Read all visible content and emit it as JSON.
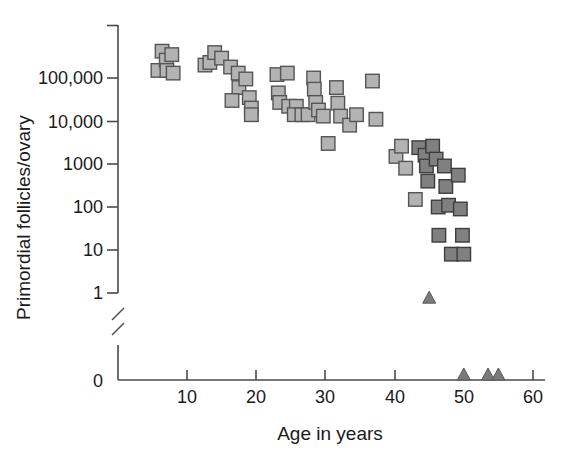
{
  "chart_data": {
    "type": "scatter",
    "title": "",
    "xlabel": "Age in years",
    "ylabel": "Primordial follicles/ovary",
    "xlim": [
      0,
      60
    ],
    "ylim_log": [
      1,
      1000000
    ],
    "yscale": "log",
    "grid": false,
    "axis_break": true,
    "axis_break_note": "Break between 1 and 0 on the y-axis",
    "xticks": [
      10,
      20,
      30,
      40,
      50,
      60
    ],
    "xtick_labels": [
      "10",
      "20",
      "30",
      "40",
      "50",
      "60"
    ],
    "yticks": [
      0,
      1,
      10,
      100,
      1000,
      10000,
      100000
    ],
    "ytick_labels": [
      "0",
      "1",
      "10",
      "100",
      "1000",
      "10,000",
      "100,000"
    ],
    "legend": [],
    "series": [
      {
        "name": "light-squares",
        "marker": "square",
        "color": "#b3b3b3",
        "points": [
          {
            "age": 5.8,
            "follicles": 150000
          },
          {
            "age": 6.4,
            "follicles": 420000
          },
          {
            "age": 7.0,
            "follicles": 260000
          },
          {
            "age": 7.1,
            "follicles": 150000
          },
          {
            "age": 7.8,
            "follicles": 350000
          },
          {
            "age": 8.0,
            "follicles": 130000
          },
          {
            "age": 12.6,
            "follicles": 200000
          },
          {
            "age": 13.3,
            "follicles": 230000
          },
          {
            "age": 14.0,
            "follicles": 390000
          },
          {
            "age": 15.0,
            "follicles": 290000
          },
          {
            "age": 16.3,
            "follicles": 180000
          },
          {
            "age": 17.4,
            "follicles": 130000
          },
          {
            "age": 17.5,
            "follicles": 60000
          },
          {
            "age": 18.5,
            "follicles": 95000
          },
          {
            "age": 19.0,
            "follicles": 35000
          },
          {
            "age": 19.3,
            "follicles": 20000
          },
          {
            "age": 19.3,
            "follicles": 14000
          },
          {
            "age": 16.5,
            "follicles": 30000
          },
          {
            "age": 23.0,
            "follicles": 120000
          },
          {
            "age": 23.2,
            "follicles": 45000
          },
          {
            "age": 23.4,
            "follicles": 27000
          },
          {
            "age": 24.5,
            "follicles": 130000
          },
          {
            "age": 24.7,
            "follicles": 22000
          },
          {
            "age": 25.8,
            "follicles": 22000
          },
          {
            "age": 25.5,
            "follicles": 14000
          },
          {
            "age": 26.6,
            "follicles": 14000
          },
          {
            "age": 27.5,
            "follicles": 14000
          },
          {
            "age": 28.3,
            "follicles": 100000
          },
          {
            "age": 28.4,
            "follicles": 55000
          },
          {
            "age": 28.6,
            "follicles": 27000
          },
          {
            "age": 29.0,
            "follicles": 18000
          },
          {
            "age": 29.7,
            "follicles": 13000
          },
          {
            "age": 30.4,
            "follicles": 3000
          },
          {
            "age": 31.6,
            "follicles": 60000
          },
          {
            "age": 31.8,
            "follicles": 26000
          },
          {
            "age": 32.2,
            "follicles": 13000
          },
          {
            "age": 33.5,
            "follicles": 8000
          },
          {
            "age": 34.5,
            "follicles": 14000
          },
          {
            "age": 36.8,
            "follicles": 85000
          },
          {
            "age": 37.3,
            "follicles": 11000
          },
          {
            "age": 40.2,
            "follicles": 1500
          },
          {
            "age": 41.0,
            "follicles": 2600
          },
          {
            "age": 41.6,
            "follicles": 800
          },
          {
            "age": 43.0,
            "follicles": 150
          }
        ]
      },
      {
        "name": "dark-squares",
        "marker": "square",
        "color": "#808080",
        "points": [
          {
            "age": 43.5,
            "follicles": 2400
          },
          {
            "age": 44.4,
            "follicles": 1600
          },
          {
            "age": 44.6,
            "follicles": 900
          },
          {
            "age": 44.8,
            "follicles": 400
          },
          {
            "age": 45.5,
            "follicles": 2600
          },
          {
            "age": 46.0,
            "follicles": 1300
          },
          {
            "age": 46.3,
            "follicles": 100
          },
          {
            "age": 46.4,
            "follicles": 22
          },
          {
            "age": 47.2,
            "follicles": 900
          },
          {
            "age": 47.4,
            "follicles": 300
          },
          {
            "age": 47.8,
            "follicles": 110
          },
          {
            "age": 48.2,
            "follicles": 8
          },
          {
            "age": 49.2,
            "follicles": 550
          },
          {
            "age": 49.5,
            "follicles": 90
          },
          {
            "age": 49.8,
            "follicles": 22
          },
          {
            "age": 50.0,
            "follicles": 8
          }
        ]
      },
      {
        "name": "triangles",
        "marker": "triangle",
        "color": "#7a7a7a",
        "points": [
          {
            "age": 45.0,
            "follicles": 0.8
          },
          {
            "age": 50.0,
            "follicles": 0
          },
          {
            "age": 53.5,
            "follicles": 0
          },
          {
            "age": 55.0,
            "follicles": 0
          }
        ]
      }
    ]
  },
  "colors": {
    "light_marker": "#b3b3b3",
    "dark_marker": "#808080",
    "triangle_marker": "#7a7a7a",
    "axis": "#4a4a4a",
    "text": "#1a1a1a",
    "background": "#ffffff"
  }
}
